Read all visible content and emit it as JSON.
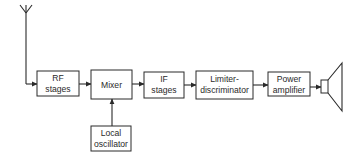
{
  "diagram": {
    "type": "block-diagram",
    "colors": {
      "line": "#2a2a2a",
      "background": "#ffffff"
    },
    "blocks": [
      {
        "id": "rf",
        "lines": [
          "RF",
          "stages"
        ]
      },
      {
        "id": "mixer",
        "lines": [
          "Mixer"
        ]
      },
      {
        "id": "if",
        "lines": [
          "IF",
          "stages"
        ]
      },
      {
        "id": "limiter",
        "lines": [
          "Limiter-",
          "discriminator"
        ]
      },
      {
        "id": "power",
        "lines": [
          "Power",
          "amplifier"
        ]
      },
      {
        "id": "lo",
        "lines": [
          "Local",
          "oscillator"
        ]
      }
    ],
    "connections": [
      {
        "from": "antenna",
        "to": "rf"
      },
      {
        "from": "rf",
        "to": "mixer"
      },
      {
        "from": "lo",
        "to": "mixer"
      },
      {
        "from": "mixer",
        "to": "if"
      },
      {
        "from": "if",
        "to": "limiter"
      },
      {
        "from": "limiter",
        "to": "power"
      },
      {
        "from": "power",
        "to": "speaker"
      }
    ],
    "icons": {
      "source": "antenna-icon",
      "sink": "loudspeaker-icon"
    }
  }
}
